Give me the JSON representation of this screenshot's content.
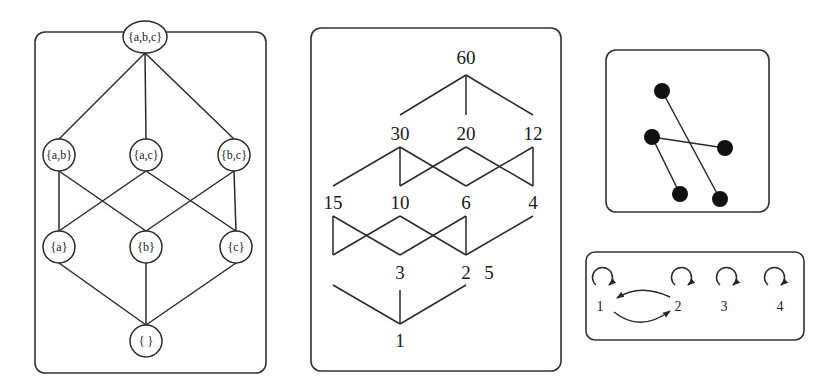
{
  "figure": {
    "panels": [
      {
        "id": "powerset-lattice",
        "description": "Hasse diagram of subsets of {a,b,c}",
        "nodes": [
          {
            "id": "abc",
            "label": "{a,b,c}"
          },
          {
            "id": "ab",
            "label": "{a,b}"
          },
          {
            "id": "ac",
            "label": "{a,c}"
          },
          {
            "id": "bc",
            "label": "{b,c}"
          },
          {
            "id": "a",
            "label": "{a}"
          },
          {
            "id": "b",
            "label": "{b}"
          },
          {
            "id": "c",
            "label": "{c}"
          },
          {
            "id": "empty",
            "label": "{ }"
          }
        ],
        "edges": [
          [
            "abc",
            "ab"
          ],
          [
            "abc",
            "ac"
          ],
          [
            "abc",
            "bc"
          ],
          [
            "ab",
            "a"
          ],
          [
            "ab",
            "b"
          ],
          [
            "ac",
            "a"
          ],
          [
            "ac",
            "c"
          ],
          [
            "bc",
            "b"
          ],
          [
            "bc",
            "c"
          ],
          [
            "a",
            "empty"
          ],
          [
            "b",
            "empty"
          ],
          [
            "c",
            "empty"
          ]
        ]
      },
      {
        "id": "divisor-lattice",
        "description": "Hasse diagram of divisors of 60",
        "nodes": [
          {
            "id": "60",
            "label": "60"
          },
          {
            "id": "30",
            "label": "30"
          },
          {
            "id": "20",
            "label": "20"
          },
          {
            "id": "12",
            "label": "12"
          },
          {
            "id": "15",
            "label": "15"
          },
          {
            "id": "10",
            "label": "10"
          },
          {
            "id": "6",
            "label": "6"
          },
          {
            "id": "4",
            "label": "4"
          },
          {
            "id": "3",
            "label": "3"
          },
          {
            "id": "2",
            "label": "2"
          },
          {
            "id": "5",
            "label": "5"
          },
          {
            "id": "1",
            "label": "1"
          }
        ]
      },
      {
        "id": "matching-graph",
        "description": "Graph with five black vertices and three edges",
        "vertex_count": 5,
        "edge_count": 3
      },
      {
        "id": "relation-digraph",
        "description": "Directed graph with self-loops on 1,2,3,4 and arcs between 1 and 2",
        "nodes": [
          {
            "id": "1",
            "label": "1"
          },
          {
            "id": "2",
            "label": "2"
          },
          {
            "id": "3",
            "label": "3"
          },
          {
            "id": "4",
            "label": "4"
          }
        ],
        "arcs": [
          [
            "1",
            "1"
          ],
          [
            "2",
            "2"
          ],
          [
            "3",
            "3"
          ],
          [
            "4",
            "4"
          ],
          [
            "1",
            "2"
          ],
          [
            "2",
            "1"
          ]
        ]
      }
    ],
    "colors": {
      "stroke": "#2a2a2a",
      "fill_dot": "#111111",
      "background": "#ffffff"
    }
  }
}
